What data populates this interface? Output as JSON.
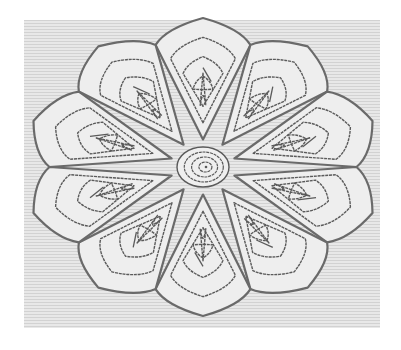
{
  "image": {
    "subject": "embroidered flower medallion with ten spiral petals",
    "canvas": {
      "width": 401,
      "height": 350,
      "background": "#ffffff"
    },
    "fabric": {
      "x": 24,
      "y": 20,
      "width": 356,
      "height": 308,
      "color": "#e6e6e6",
      "stripe_color": "#d4d4d4"
    },
    "flower": {
      "cx": 203,
      "cy": 167,
      "rx": 165,
      "ry": 138,
      "petal_count": 10,
      "rotation_deg": -90,
      "outline_color": "#6a6a6a",
      "thread_color": "#5a5a5a",
      "fill_color": "#eeeeee",
      "nested_rings": 5,
      "center_rings": 4,
      "center_rx": 26,
      "center_ry": 20
    }
  }
}
